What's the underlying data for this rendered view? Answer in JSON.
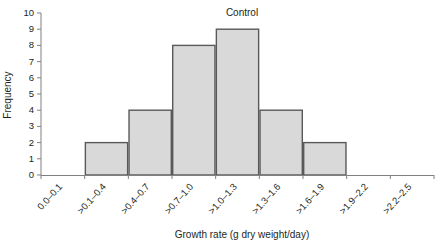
{
  "chart_data": {
    "type": "bar",
    "title": "Control",
    "xlabel": "Growth rate (g dry weight/day)",
    "ylabel": "Frequency",
    "categories": [
      "0.0–0.1",
      ">0.1–0.4",
      ">0.4–0.7",
      ">0.7–1.0",
      ">1.0–1.3",
      ">1.3–1.6",
      ">1.6–1.9",
      ">1.9–2.2",
      ">2.2–2.5"
    ],
    "values": [
      0,
      2,
      4,
      8,
      9,
      4,
      2,
      0,
      0
    ],
    "ylim": [
      0,
      10
    ],
    "yticks": [
      0,
      1,
      2,
      3,
      4,
      5,
      6,
      7,
      8,
      9,
      10
    ],
    "ytick_labels": [
      "0",
      "1",
      "2",
      "3",
      "4",
      "5",
      "6",
      "7",
      "8",
      "9",
      "10"
    ],
    "grid": false,
    "legend": "none",
    "bar_fill_color": "#d9d9d9",
    "bar_edge_color": "#595959",
    "axis_color": "#808080",
    "text_color": "#231f20",
    "xtick_label_rotation": -48
  }
}
